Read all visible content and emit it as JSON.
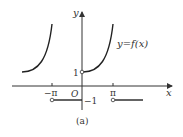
{
  "diagram": {
    "caption": "(a)",
    "function_label": "y=f(x)",
    "axes": {
      "x_label": "x",
      "y_label": "y",
      "origin_label": "O"
    },
    "ticks": {
      "neg_pi": "−π",
      "pi": "π",
      "one": "1",
      "neg_one": "−1"
    },
    "pieces": [
      {
        "domain": "(-π, 0)",
        "shape": "increasing convex curve above y=1"
      },
      {
        "domain": "[0, π)",
        "shape": "increasing convex curve starting at (0,1) open"
      },
      {
        "domain": "[-π, 0)",
        "value": -1,
        "left_endpoint": "open"
      },
      {
        "domain": "[π, 2π)",
        "value": -1,
        "left_endpoint": "open"
      }
    ]
  }
}
